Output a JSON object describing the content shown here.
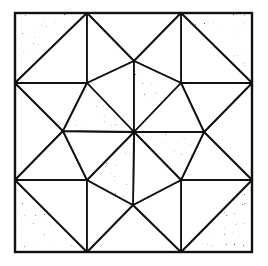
{
  "figure": {
    "title": "Quilt block: octagon pinwheel with star points",
    "width": 268,
    "height": 266,
    "outline_color": "#111111",
    "outline_width": 1.8,
    "shades": {
      "dark": {
        "base": "#ffffff",
        "ink": "#1a1a1a",
        "density": 0.62
      },
      "light": {
        "base": "#ffffff",
        "ink": "#3a3a3a",
        "density": 0.3
      },
      "white": {
        "base": "#ffffff",
        "ink": "#ffffff",
        "density": 0
      }
    },
    "points": {
      "TL": [
        15,
        13
      ],
      "T1": [
        87,
        13
      ],
      "T2": [
        181,
        13
      ],
      "TR": [
        252,
        13
      ],
      "L1": [
        15,
        83
      ],
      "A": [
        87,
        83
      ],
      "B": [
        181,
        83
      ],
      "R1": [
        252,
        83
      ],
      "L2": [
        15,
        180
      ],
      "D": [
        87,
        180
      ],
      "C": [
        181,
        180
      ],
      "R2": [
        252,
        180
      ],
      "BL": [
        15,
        252
      ],
      "B1": [
        87,
        252
      ],
      "B2": [
        181,
        252
      ],
      "BR": [
        252,
        252
      ],
      "NT": [
        134,
        61
      ],
      "NL": [
        63,
        131
      ],
      "NR": [
        204,
        132
      ],
      "NB": [
        133,
        205
      ],
      "O": [
        134,
        132
      ]
    },
    "pieces": [
      {
        "name": "corner-tl-outer",
        "shade": "dark",
        "pts": [
          "TL",
          "T1",
          "L1"
        ]
      },
      {
        "name": "corner-tl-inner",
        "shade": "light",
        "pts": [
          "T1",
          "A",
          "L1"
        ]
      },
      {
        "name": "corner-tr-outer",
        "shade": "dark",
        "pts": [
          "T2",
          "TR",
          "R1"
        ]
      },
      {
        "name": "corner-tr-inner",
        "shade": "light",
        "pts": [
          "T2",
          "R1",
          "B"
        ]
      },
      {
        "name": "corner-bl-outer",
        "shade": "dark",
        "pts": [
          "L2",
          "B1",
          "BL"
        ]
      },
      {
        "name": "corner-bl-inner",
        "shade": "light",
        "pts": [
          "L2",
          "D",
          "B1"
        ]
      },
      {
        "name": "corner-br-outer",
        "shade": "dark",
        "pts": [
          "R2",
          "BR",
          "B2"
        ]
      },
      {
        "name": "corner-br-inner",
        "shade": "light",
        "pts": [
          "C",
          "R2",
          "B2"
        ]
      },
      {
        "name": "top-point",
        "shade": "light",
        "pts": [
          "T1",
          "T2",
          "NT"
        ]
      },
      {
        "name": "top-left-wing",
        "shade": "white",
        "pts": [
          "T1",
          "NT",
          "A"
        ]
      },
      {
        "name": "top-right-wing",
        "shade": "white",
        "pts": [
          "T2",
          "B",
          "NT"
        ]
      },
      {
        "name": "left-point",
        "shade": "light",
        "pts": [
          "L1",
          "NL",
          "L2"
        ]
      },
      {
        "name": "left-top-wing",
        "shade": "white",
        "pts": [
          "L1",
          "A",
          "NL"
        ]
      },
      {
        "name": "left-bottom-wing",
        "shade": "white",
        "pts": [
          "L2",
          "NL",
          "D"
        ]
      },
      {
        "name": "right-point",
        "shade": "light",
        "pts": [
          "R1",
          "R2",
          "NR"
        ]
      },
      {
        "name": "right-top-wing",
        "shade": "white",
        "pts": [
          "B",
          "R1",
          "NR"
        ]
      },
      {
        "name": "right-bottom-wing",
        "shade": "white",
        "pts": [
          "NR",
          "R2",
          "C"
        ]
      },
      {
        "name": "bottom-point",
        "shade": "light",
        "pts": [
          "B1",
          "NB",
          "B2"
        ]
      },
      {
        "name": "bottom-left-wing",
        "shade": "white",
        "pts": [
          "D",
          "NB",
          "B1"
        ]
      },
      {
        "name": "bottom-right-wing",
        "shade": "white",
        "pts": [
          "NB",
          "C",
          "B2"
        ]
      },
      {
        "name": "octagon-top-left",
        "shade": "light",
        "pts": [
          "O",
          "A",
          "NT"
        ]
      },
      {
        "name": "octagon-top-right",
        "shade": "dark",
        "pts": [
          "O",
          "NT",
          "B"
        ]
      },
      {
        "name": "octagon-right-top",
        "shade": "light",
        "pts": [
          "O",
          "B",
          "NR"
        ]
      },
      {
        "name": "octagon-right-bottom",
        "shade": "dark",
        "pts": [
          "O",
          "NR",
          "C"
        ]
      },
      {
        "name": "octagon-bottom-right",
        "shade": "light",
        "pts": [
          "O",
          "C",
          "NB"
        ]
      },
      {
        "name": "octagon-bottom-left",
        "shade": "dark",
        "pts": [
          "O",
          "NB",
          "D"
        ]
      },
      {
        "name": "octagon-left-bottom",
        "shade": "light",
        "pts": [
          "O",
          "D",
          "NL"
        ]
      },
      {
        "name": "octagon-left-top",
        "shade": "dark",
        "pts": [
          "O",
          "NL",
          "A"
        ]
      }
    ]
  }
}
